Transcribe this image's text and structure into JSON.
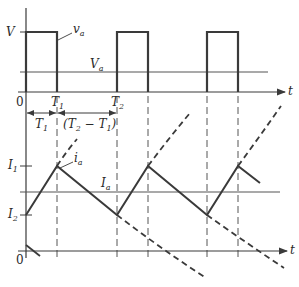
{
  "diagram": {
    "type": "waveform",
    "colors": {
      "stroke": "#3a3a3a",
      "thin": "#555555",
      "background": "#ffffff"
    },
    "voltage_plot": {
      "y_label_V": "V",
      "zero_label": "0",
      "time_axis_label": "t",
      "waveform_label": "v",
      "waveform_label_sub": "a",
      "mean_label": "V",
      "mean_label_sub": "a",
      "tick_T1": "T",
      "tick_T1_sub": "1",
      "tick_T2": "T",
      "tick_T2_sub": "2",
      "pulses": [
        {
          "start": 26,
          "end": 57
        },
        {
          "start": 117,
          "end": 148
        },
        {
          "start": 207,
          "end": 238
        }
      ]
    },
    "dimensions": {
      "on_interval": "T",
      "on_interval_sub": "1",
      "off_interval_open": "(T",
      "off_interval_sub2": "2",
      "off_interval_mid": " − T",
      "off_interval_sub1": "1",
      "off_interval_close": ")"
    },
    "current_plot": {
      "I1_label": "I",
      "I1_sub": "1",
      "I2_label": "I",
      "I2_sub": "2",
      "waveform_label": "i",
      "waveform_label_sub": "a",
      "mean_label": "I",
      "mean_label_sub": "a",
      "zero_label": "0",
      "time_axis_label": "t"
    }
  }
}
